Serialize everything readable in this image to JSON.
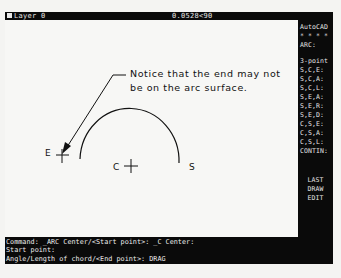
{
  "status_bar": {
    "layer": "Layer 0",
    "coordinates": "0.0528<90"
  },
  "side_menu": {
    "title": "AutoCAD",
    "separator": "* * * *",
    "header": "ARC:",
    "items": [
      "3-point",
      "S,C,E:",
      "S,C,A:",
      "S,C,L:",
      "S,E,A:",
      "S,E,R:",
      "S,E,D:",
      "C,S,E:",
      "C,S,A:",
      "C,S,L:",
      "CONTIN:"
    ],
    "bottom_items": [
      "LAST",
      "DRAW",
      "EDIT"
    ]
  },
  "drawing": {
    "annotation_line1": "Notice that the end may not",
    "annotation_line2": "be on the arc surface.",
    "labels": {
      "end": "E",
      "center": "C",
      "start": "S"
    },
    "colors": {
      "background": "#f7f7f5",
      "ink": "#111111"
    }
  },
  "command_area": {
    "lines": [
      "Command:  _ARC Center/<Start point>: _C Center:",
      "Start point:",
      "Angle/Length of chord/<End point>: DRAG"
    ]
  }
}
